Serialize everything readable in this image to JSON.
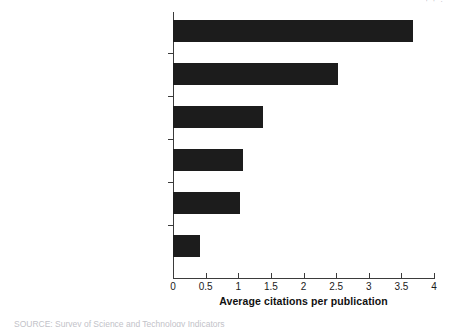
{
  "figure": {
    "top_cropped_text": "⌐  ⌐  ,",
    "bottom_cropped_text": "SOURCE: Survey of Science and Technology Indicators"
  },
  "chart_data": {
    "type": "bar",
    "orientation": "horizontal",
    "title": "",
    "xlabel": "Average citations per publication",
    "ylabel": "",
    "xlim": [
      0,
      4
    ],
    "xticks": [
      0,
      0.5,
      1,
      1.5,
      2,
      2.5,
      3,
      3.5,
      4
    ],
    "xticklabels": [
      "0",
      "0.5",
      "1",
      "1.5",
      "2",
      "2.5",
      "3",
      "3.5",
      "4"
    ],
    "grid": false,
    "legend": false,
    "bar_color": "#1c1c1c",
    "categories": [
      "Medical and life sciences",
      "Natural sciences",
      "Social and behavioural sciences",
      "Language, information and\ncommunication",
      "Engineering sciences",
      "Law, arts and humanities"
    ],
    "values": [
      3.68,
      2.53,
      1.38,
      1.07,
      1.02,
      0.41
    ]
  }
}
